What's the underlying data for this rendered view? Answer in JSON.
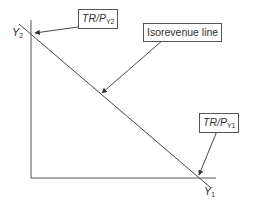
{
  "diagram": {
    "axes": {
      "y_label": "Y",
      "y_label_sub": "2",
      "x_label": "Y",
      "x_label_sub": "1"
    },
    "callouts": {
      "y_intercept": {
        "main": "TR/P",
        "sub": "Y2"
      },
      "line": {
        "text": "Isorevenue line"
      },
      "x_intercept": {
        "main": "TR/P",
        "sub": "Y1"
      }
    },
    "colors": {
      "line": "#444444",
      "text": "#333333",
      "background": "#ffffff"
    }
  }
}
